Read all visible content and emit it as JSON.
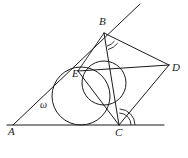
{
  "figure": {
    "kind": "geometry-diagram",
    "width": 188,
    "height": 158,
    "background_color": "#ffffff",
    "stroke_color": "#1a1a1a",
    "stroke_width": 0.9
  },
  "points": {
    "A": {
      "label": "A",
      "x": 13,
      "y": 125,
      "label_x": 8,
      "label_y": 131
    },
    "B": {
      "label": "B",
      "x": 104,
      "y": 33,
      "label_x": 99,
      "label_y": 21
    },
    "C": {
      "label": "C",
      "x": 119,
      "y": 125,
      "label_x": 115,
      "label_y": 132
    },
    "D": {
      "label": "D",
      "x": 169,
      "y": 65,
      "label_x": 172,
      "label_y": 67
    },
    "E": {
      "label": "E",
      "x": 78,
      "y": 71,
      "label_x": 74,
      "label_y": 74
    }
  },
  "circle_labels": {
    "omega": {
      "label": "ω",
      "x": 43,
      "y": 104
    }
  },
  "circles": [
    {
      "name": "incircle-omega",
      "cx": 81,
      "cy": 96,
      "r": 29,
      "note": "circle omega, tangent to line AC at bottom and to line AB at E"
    },
    {
      "name": "secondary-circle",
      "cx": 104,
      "cy": 83,
      "r": 22,
      "note": "smaller circle through E and near C"
    }
  ],
  "segments": [
    {
      "name": "ray-A-through-B",
      "x1": 13,
      "y1": 125,
      "x2": 140,
      "y2": 4
    },
    {
      "name": "base-line-A-C-extended",
      "x1": 7,
      "y1": 125,
      "x2": 164,
      "y2": 125
    },
    {
      "name": "segment-B-C",
      "x1": 104,
      "y1": 33,
      "x2": 119,
      "y2": 125
    },
    {
      "name": "segment-B-D",
      "x1": 104,
      "y1": 33,
      "x2": 169,
      "y2": 65
    },
    {
      "name": "segment-C-D",
      "x1": 119,
      "y1": 125,
      "x2": 169,
      "y2": 65
    },
    {
      "name": "segment-E-D",
      "x1": 78,
      "y1": 71,
      "x2": 169,
      "y2": 65
    },
    {
      "name": "segment-B-E-chord",
      "x1": 104,
      "y1": 33,
      "x2": 78,
      "y2": 71
    },
    {
      "name": "segment-E-C",
      "x1": 78,
      "y1": 71,
      "x2": 119,
      "y2": 125
    }
  ],
  "angle_marks": [
    {
      "name": "angle-mark-B-outer",
      "vertex": "B",
      "radius": 17
    },
    {
      "name": "angle-mark-B-inner",
      "vertex": "B",
      "radius": 13
    },
    {
      "name": "angle-mark-C-outer",
      "vertex": "C",
      "radius": 16
    },
    {
      "name": "angle-mark-C-inner",
      "vertex": "C",
      "radius": 12
    }
  ]
}
